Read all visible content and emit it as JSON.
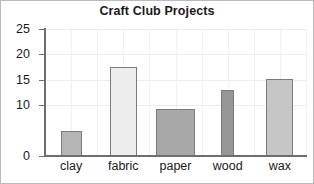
{
  "chart_data": {
    "type": "bar",
    "title": "Craft Club Projects",
    "xlabel": "",
    "ylabel": "",
    "categories": [
      "clay",
      "fabric",
      "paper",
      "wood",
      "wax"
    ],
    "values": [
      5,
      17.5,
      9.2,
      13,
      15.2
    ],
    "ylim": [
      0,
      25
    ],
    "yticks": [
      0,
      10,
      15,
      20,
      25
    ],
    "ytick_labels": [
      "0",
      "10",
      "15",
      "20",
      "25"
    ],
    "grid": true,
    "legend": "none",
    "bar_colors": [
      "#b6b6b6",
      "#ededed",
      "#a8a8a8",
      "#969696",
      "#c6c6c6"
    ],
    "bar_edge_color": "#7b7b7b"
  },
  "axis": {
    "tick_0": "0",
    "tick_10": "10",
    "tick_15": "15",
    "tick_20": "20",
    "tick_25": "25"
  },
  "labels": {
    "clay": "clay",
    "fabric": "fabric",
    "paper": "paper",
    "wood": "wood",
    "wax": "wax"
  }
}
